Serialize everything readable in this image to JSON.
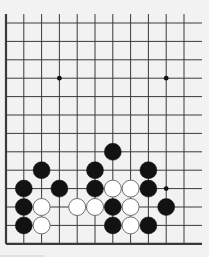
{
  "diagram": {
    "type": "go-board-fragment",
    "visible_columns": 11,
    "visible_rows": 13,
    "edges": {
      "left": true,
      "bottom": true,
      "top": false,
      "right": false
    },
    "colors": {
      "background": "#f2f2f2",
      "line": "#3a3a3a",
      "black_stone": "#121212",
      "white_stone": "#ffffff",
      "white_outline": "#6e6e6e"
    },
    "star_points": [
      {
        "col": 3,
        "row": 3
      },
      {
        "col": 9,
        "row": 3
      },
      {
        "col": 9,
        "row": 9
      }
    ],
    "stones": [
      {
        "color": "black",
        "col": 6,
        "row": 7
      },
      {
        "color": "black",
        "col": 2,
        "row": 8
      },
      {
        "color": "black",
        "col": 5,
        "row": 8
      },
      {
        "color": "black",
        "col": 8,
        "row": 8
      },
      {
        "color": "black",
        "col": 1,
        "row": 9
      },
      {
        "color": "black",
        "col": 3,
        "row": 9
      },
      {
        "color": "black",
        "col": 5,
        "row": 9
      },
      {
        "color": "white",
        "col": 6,
        "row": 9
      },
      {
        "color": "white",
        "col": 7,
        "row": 9
      },
      {
        "color": "black",
        "col": 8,
        "row": 9
      },
      {
        "color": "black",
        "col": 1,
        "row": 10
      },
      {
        "color": "white",
        "col": 2,
        "row": 10
      },
      {
        "color": "white",
        "col": 4,
        "row": 10
      },
      {
        "color": "white",
        "col": 5,
        "row": 10
      },
      {
        "color": "black",
        "col": 6,
        "row": 10
      },
      {
        "color": "white",
        "col": 7,
        "row": 10
      },
      {
        "color": "black",
        "col": 9,
        "row": 10
      },
      {
        "color": "black",
        "col": 1,
        "row": 11
      },
      {
        "color": "white",
        "col": 2,
        "row": 11
      },
      {
        "color": "black",
        "col": 6,
        "row": 11
      },
      {
        "color": "white",
        "col": 7,
        "row": 11
      },
      {
        "color": "black",
        "col": 8,
        "row": 11
      }
    ]
  }
}
